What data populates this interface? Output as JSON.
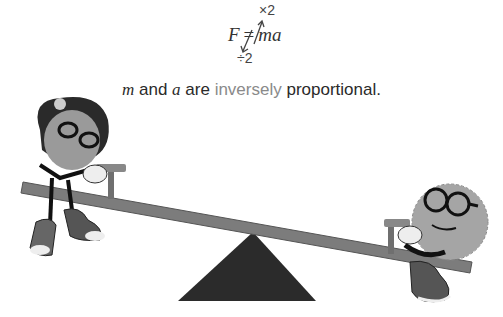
{
  "formula": {
    "lhs": "F",
    "equals": "=",
    "rhs_m": "m",
    "rhs_a": "a",
    "multiply_label": "×2",
    "divide_label": "÷2"
  },
  "caption": {
    "var1": "m",
    "and": " and ",
    "var2": "a",
    "are": " are ",
    "highlight": "inversely",
    "rest": " proportional."
  },
  "scene": {
    "characters": [
      "girl-character-heavy",
      "boy-character-light"
    ],
    "colors": {
      "board": "#7a7a7a",
      "fulcrum": "#2b2b2b",
      "skin": "#9a9a9a",
      "hair": "#2a2a2a"
    }
  }
}
